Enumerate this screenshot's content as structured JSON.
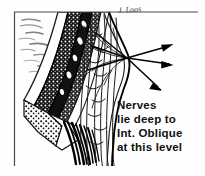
{
  "figure": {
    "kind": "anatomical-line-drawing",
    "signature": "J. Loos",
    "ink_color": "#111111",
    "background_color": "#fefefe",
    "border_color": "#555555"
  },
  "caption": {
    "lines": [
      "Nerves",
      "lie deep to",
      "Int. Oblique",
      "at this level"
    ]
  },
  "leaders": {
    "origin": {
      "x": 127,
      "y": 58
    },
    "arrows": [
      {
        "name": "nerve-arrow-upper",
        "x": 171,
        "y": 45
      },
      {
        "name": "nerve-arrow-middle",
        "x": 171,
        "y": 64
      },
      {
        "name": "nerve-arrow-lower",
        "x": 160,
        "y": 89
      }
    ],
    "tails": [
      {
        "name": "nerve-tail-upper",
        "x": 96,
        "y": 33
      },
      {
        "name": "nerve-tail-mid",
        "x": 92,
        "y": 46
      },
      {
        "name": "nerve-tail-lower",
        "x": 88,
        "y": 70
      }
    ]
  },
  "frame": {
    "top_rule": {
      "x1": 14,
      "y1": 12,
      "x2": 198,
      "y2": 12
    },
    "left_rule": {
      "x1": 14,
      "y1": 12,
      "x2": 14,
      "y2": 166
    }
  },
  "layers": [
    {
      "name": "skin-hatching",
      "tone": "light"
    },
    {
      "name": "external-oblique-band",
      "tone": "dark"
    },
    {
      "name": "internal-oblique-band",
      "tone": "dark"
    },
    {
      "name": "transversus-band",
      "tone": "mid"
    },
    {
      "name": "fat-stipple-region",
      "tone": "stipple"
    },
    {
      "name": "rectus-fiber-region",
      "tone": "outline"
    }
  ]
}
